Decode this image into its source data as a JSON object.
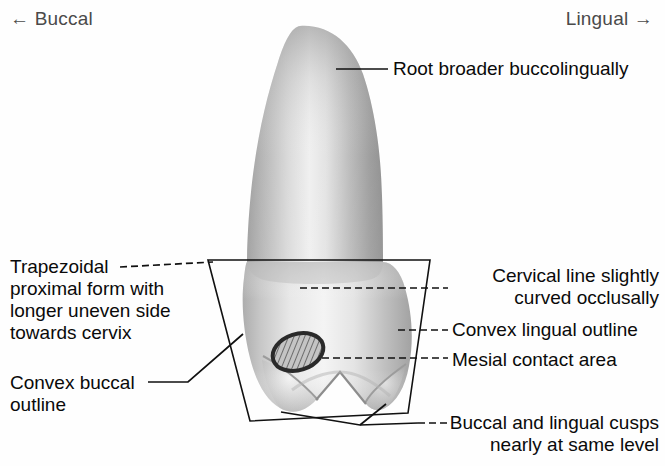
{
  "figure": {
    "background_color": "#fefefe",
    "line_color": "#111111",
    "text_color": "#0a0a0a",
    "axis_text_color": "#4a4a4a"
  },
  "orientation": {
    "left_label": "← Buccal",
    "right_label": "Lingual →"
  },
  "annotations": [
    {
      "id": "root",
      "text": "Root broader buccolingually",
      "align": "left",
      "leader": {
        "from": [
          336,
          69
        ],
        "to": [
          388,
          69
        ],
        "style": "solid"
      }
    },
    {
      "id": "trapezoidal",
      "text": "Trapezoidal\nproximal form with\nlonger uneven side\ntowards cervix",
      "align": "left",
      "leader": {
        "from": [
          120,
          267
        ],
        "to": [
          213,
          262
        ],
        "style": "dashed"
      }
    },
    {
      "id": "cervical-line",
      "text": "Cervical line slightly\ncurved occlusally",
      "align": "right",
      "leader": {
        "from": [
          300,
          288
        ],
        "to": [
          448,
          288
        ],
        "style": "dashed"
      }
    },
    {
      "id": "convex-lingual",
      "text": "Convex lingual outline",
      "align": "left",
      "leader": {
        "from": [
          398,
          330
        ],
        "to": [
          448,
          330
        ],
        "style": "dashed"
      }
    },
    {
      "id": "mesial-contact",
      "text": "Mesial contact area",
      "align": "left",
      "leader": {
        "from": [
          322,
          358
        ],
        "to": [
          448,
          358
        ],
        "style": "dashed"
      }
    },
    {
      "id": "convex-buccal",
      "text": "Convex buccal\noutline",
      "align": "left",
      "leader": {
        "from": [
          148,
          382
        ],
        "to": [
          243,
          334
        ],
        "style": "solid"
      }
    },
    {
      "id": "cusps-level",
      "text": "Buccal and lingual cusps\nnearly at same level",
      "align": "right",
      "leader": {
        "from": [
          281,
          412
        ],
        "to": [
          418,
          423
        ],
        "style": "dashed"
      }
    }
  ],
  "tooth": {
    "name": "mandibular-premolar-proximal-view",
    "parts": {
      "root": "tapered rounded root, broader buccolingually",
      "crown": "convex buccal and lingual outlines with two cusps",
      "cusp_buccal": "buccal cusp",
      "cusp_lingual": "lingual cusp",
      "contact_area": "hatched oval mesial contact area"
    },
    "shading": {
      "light": "#f2f2f2",
      "mid": "#c9c9c9",
      "dark": "#8f8f8f",
      "darkest": "#6e6e6e"
    }
  },
  "overlay": {
    "shape": "trapezoid",
    "stroke": "#111111",
    "points": "208,260 430,260 408,413 250,421"
  },
  "contact_ellipse": {
    "center": [
      298,
      352
    ],
    "rx": 26,
    "ry": 18,
    "rotation_deg": -18,
    "fill": "hatched",
    "stroke": "#2a2a2a"
  }
}
